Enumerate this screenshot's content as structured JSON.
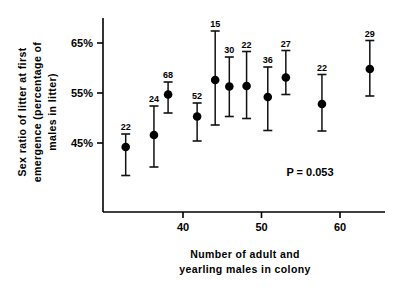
{
  "chart_data": {
    "type": "scatter",
    "title": "",
    "xlabel": "Number of adult and yearling males in colony",
    "xlabel_lines": [
      "Number of adult and",
      "yearling males in colony"
    ],
    "ylabel": "Sex ratio of litter at first emergence (percentage of males in litter)",
    "ylabel_lines": [
      "Sex ratio of litter at first",
      "emergence (percentage of",
      "males in litter)"
    ],
    "xlim": [
      30,
      67
    ],
    "ylim": [
      37,
      68
    ],
    "xticks": [
      40,
      50,
      60
    ],
    "xticklabels": [
      "40",
      "50",
      "60"
    ],
    "yticks": [
      45,
      55,
      65
    ],
    "yticklabels": [
      "45%",
      "55%",
      "65%"
    ],
    "grid": false,
    "legend": null,
    "error_type": "95% confidence interval",
    "annotations": [
      {
        "name": "p-value",
        "text": "P = 0.053",
        "x": 57.5,
        "y": 41.5
      }
    ],
    "point_label_key": "n",
    "points": [
      {
        "n": 22,
        "x": 32.7,
        "y": 44.2,
        "y_low": 38.5,
        "y_high": 46.8
      },
      {
        "n": 24,
        "x": 36.3,
        "y": 46.6,
        "y_low": 40.2,
        "y_high": 52.4
      },
      {
        "n": 68,
        "x": 38.1,
        "y": 54.7,
        "y_low": 51.0,
        "y_high": 57.2
      },
      {
        "n": 52,
        "x": 41.8,
        "y": 50.3,
        "y_low": 45.4,
        "y_high": 53.0
      },
      {
        "n": 15,
        "x": 44.1,
        "y": 57.6,
        "y_low": 48.6,
        "y_high": 67.4
      },
      {
        "n": 30,
        "x": 45.9,
        "y": 56.3,
        "y_low": 50.3,
        "y_high": 62.2
      },
      {
        "n": 22,
        "x": 48.1,
        "y": 56.4,
        "y_low": 49.9,
        "y_high": 63.3
      },
      {
        "n": 36,
        "x": 50.8,
        "y": 54.2,
        "y_low": 47.5,
        "y_high": 60.2
      },
      {
        "n": 27,
        "x": 53.1,
        "y": 58.1,
        "y_low": 54.7,
        "y_high": 63.5
      },
      {
        "n": 22,
        "x": 57.7,
        "y": 52.8,
        "y_low": 47.4,
        "y_high": 58.7
      },
      {
        "n": 29,
        "x": 63.8,
        "y": 59.8,
        "y_low": 54.4,
        "y_high": 65.5
      }
    ]
  },
  "colors": {
    "marker": "#000000",
    "error_bar": "#111111",
    "axis": "#000000",
    "background": "#ffffff"
  }
}
